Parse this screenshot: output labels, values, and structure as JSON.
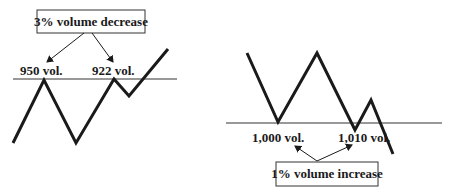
{
  "diagrams": [
    {
      "id": "left",
      "title_box": "3% volume decrease",
      "labels": [
        "950 vol.",
        "922 vol."
      ],
      "baseline": {
        "x1": 13,
        "x2": 177,
        "y": 79
      },
      "zigzag": [
        [
          13,
          143
        ],
        [
          44,
          80
        ],
        [
          76,
          143
        ],
        [
          114,
          79
        ],
        [
          129,
          96
        ],
        [
          168,
          49
        ]
      ],
      "box": {
        "x": 37,
        "y": 10,
        "w": 108,
        "h": 23
      },
      "arrows": [
        [
          [
            84,
            33
          ],
          [
            47,
            62
          ]
        ],
        [
          [
            92,
            33
          ],
          [
            113,
            62
          ]
        ]
      ],
      "label_pos": [
        [
          20,
          75
        ],
        [
          92,
          75
        ]
      ]
    },
    {
      "id": "right",
      "title_box": "1% volume increase",
      "labels": [
        "1,000 vol.",
        "1,010 vol."
      ],
      "baseline": {
        "x1": 226,
        "x2": 442,
        "y": 123
      },
      "zigzag": [
        [
          247,
          53
        ],
        [
          278,
          122
        ],
        [
          317,
          53
        ],
        [
          355,
          130
        ],
        [
          371,
          100
        ],
        [
          393,
          154
        ]
      ],
      "box": {
        "x": 276,
        "y": 162,
        "w": 102,
        "h": 24
      },
      "arrows": [
        [
          [
            317,
            161
          ],
          [
            295,
            146
          ]
        ],
        [
          [
            317,
            161
          ],
          [
            352,
            145
          ]
        ]
      ],
      "label_pos": [
        [
          252,
          142
        ],
        [
          338,
          142
        ]
      ]
    }
  ],
  "colors": {
    "line": "#1a1a1a",
    "baseline": "#333333",
    "box_border": "#333333"
  }
}
